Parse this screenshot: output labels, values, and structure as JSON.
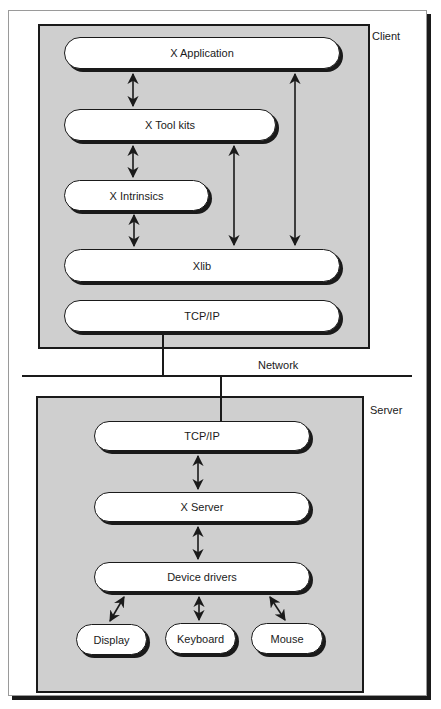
{
  "diagram": {
    "client": {
      "label": "Client",
      "layers": [
        {
          "id": "x-application",
          "label": "X Application"
        },
        {
          "id": "x-toolkits",
          "label": "X Tool kits"
        },
        {
          "id": "x-intrinsics",
          "label": "X Intrinsics"
        },
        {
          "id": "xlib",
          "label": "Xlib"
        },
        {
          "id": "tcpip",
          "label": "TCP/IP"
        }
      ]
    },
    "network": {
      "label": "Network"
    },
    "server": {
      "label": "Server",
      "layers": [
        {
          "id": "tcpip",
          "label": "TCP/IP"
        },
        {
          "id": "x-server",
          "label": "X Server"
        },
        {
          "id": "device-drivers",
          "label": "Device drivers"
        }
      ],
      "devices": [
        {
          "id": "display",
          "label": "Display"
        },
        {
          "id": "keyboard",
          "label": "Keyboard"
        },
        {
          "id": "mouse",
          "label": "Mouse"
        }
      ]
    },
    "connections": [
      {
        "from": "X Application",
        "to": "X Tool kits",
        "type": "bidirectional"
      },
      {
        "from": "X Tool kits",
        "to": "X Intrinsics",
        "type": "bidirectional"
      },
      {
        "from": "X Intrinsics",
        "to": "Xlib",
        "type": "bidirectional"
      },
      {
        "from": "X Tool kits",
        "to": "Xlib",
        "type": "bidirectional"
      },
      {
        "from": "X Application",
        "to": "Xlib",
        "type": "bidirectional"
      },
      {
        "from": "Client TCP/IP",
        "to": "Network",
        "type": "line"
      },
      {
        "from": "Network",
        "to": "Server TCP/IP",
        "type": "line"
      },
      {
        "from": "TCP/IP",
        "to": "X Server",
        "type": "bidirectional"
      },
      {
        "from": "X Server",
        "to": "Device drivers",
        "type": "bidirectional"
      },
      {
        "from": "Device drivers",
        "to": "Display",
        "type": "bidirectional"
      },
      {
        "from": "Device drivers",
        "to": "Keyboard",
        "type": "bidirectional"
      },
      {
        "from": "Device drivers",
        "to": "Mouse",
        "type": "bidirectional"
      }
    ]
  }
}
